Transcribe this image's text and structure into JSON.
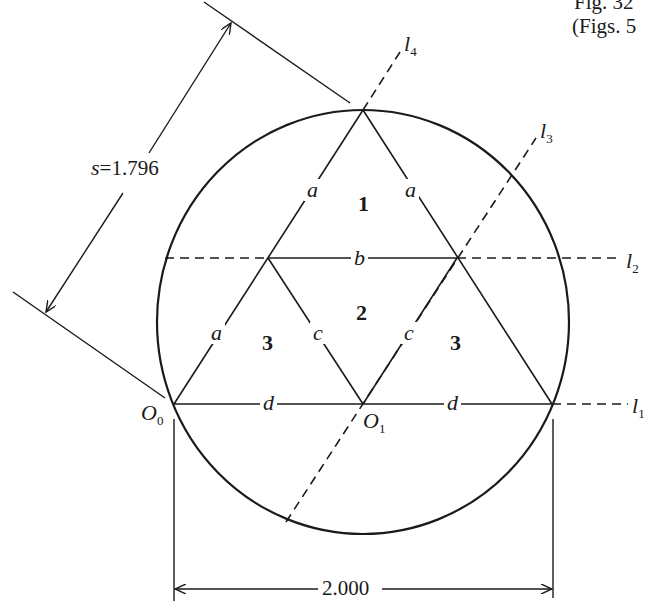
{
  "caption": {
    "line1": "Fig. 32",
    "line2": "(Figs. 5"
  },
  "dimension_s": {
    "label_var": "s",
    "label_eq": "=",
    "value": "1.796"
  },
  "dimension_width": {
    "value": "2.000"
  },
  "points": {
    "o0": {
      "name": "O",
      "sub": "0"
    },
    "o1": {
      "name": "O",
      "sub": "1"
    }
  },
  "lines": {
    "l1": {
      "name": "l",
      "sub": "1"
    },
    "l2": {
      "name": "l",
      "sub": "2"
    },
    "l3": {
      "name": "l",
      "sub": "3"
    },
    "l4": {
      "name": "l",
      "sub": "4"
    }
  },
  "segments": {
    "a_top_left": "a",
    "a_top_right": "a",
    "a_bottom_left": "a",
    "b": "b",
    "c_left": "c",
    "c_right": "c",
    "d_left": "d",
    "d_right": "d"
  },
  "regions": {
    "r1": "1",
    "r2": "2",
    "r3_left": "3",
    "r3_right": "3"
  },
  "colors": {
    "ink": "#1a1a1a",
    "background": "#ffffff"
  }
}
